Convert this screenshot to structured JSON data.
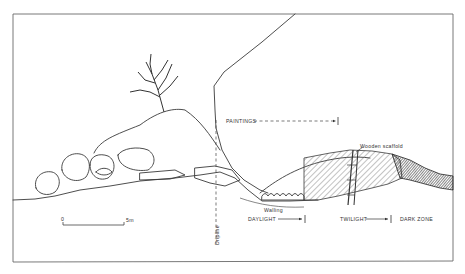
{
  "figure": {
    "type": "cave cross-section diagram",
    "labels": {
      "paintings": "PAINTINGS",
      "wooden_scaffold": "Wooden scaffold",
      "walling": "Walling",
      "dripline": "Dripline",
      "daylight": "DAYLIGHT",
      "twilight": "TWILIGHT",
      "dark_zone": "DARK ZONE"
    },
    "scale_bar": {
      "start": "0",
      "end": "5m"
    },
    "caption": ""
  },
  "colors": {
    "line": "#3a3a3a",
    "frame": "#6a6a6a",
    "hatch_light": "#666666",
    "hatch_dark": "#2a2a2a",
    "background": "#ffffff"
  }
}
